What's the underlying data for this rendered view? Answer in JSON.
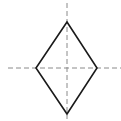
{
  "diagram": {
    "title": "",
    "shape": "rhombus",
    "colors": {
      "background": "#ffffff",
      "shape_stroke": "#1a1a1a",
      "axis_stroke": "#8a8a8a"
    },
    "rhombus": {
      "vertices": {
        "top": [
          67,
          22
        ],
        "right": [
          97,
          68
        ],
        "bottom": [
          67,
          114
        ],
        "left": [
          36,
          68
        ]
      },
      "stroke_width": 1.6
    },
    "axes": {
      "vertical": {
        "x": 67,
        "y1": 3,
        "y2": 119,
        "style": "dashed"
      },
      "horizontal": {
        "y": 68,
        "x1": 8,
        "x2": 121,
        "style": "dashed"
      },
      "dash_pattern": "5,3"
    }
  }
}
